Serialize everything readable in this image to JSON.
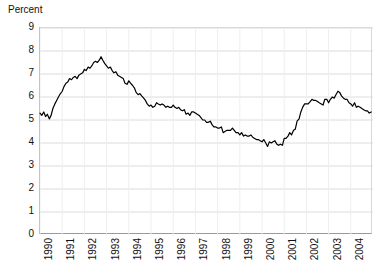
{
  "chart_data": {
    "type": "line",
    "title": "",
    "subtitle": "",
    "ylabel": "Percent",
    "xlabel": "",
    "ylim": [
      0,
      9
    ],
    "yticks": [
      0,
      1,
      2,
      3,
      4,
      5,
      6,
      7,
      8,
      9
    ],
    "ytick_labels": [
      "0",
      "1",
      "2",
      "3",
      "4",
      "5",
      "6",
      "7",
      "8",
      "9"
    ],
    "xlim": [
      1990.0,
      2005.0
    ],
    "xticks": [
      1990,
      1991,
      1992,
      1993,
      1994,
      1995,
      1996,
      1997,
      1998,
      1999,
      2000,
      2001,
      2002,
      2003,
      2004
    ],
    "xtick_labels": [
      "1990",
      "1991",
      "1992",
      "1993",
      "1994",
      "1995",
      "1996",
      "1997",
      "1998",
      "1999",
      "2000",
      "2001",
      "2002",
      "2003",
      "2004"
    ],
    "grid": true,
    "grid_color": "#dcdcdc",
    "legend": false,
    "legend_position": "none",
    "line_color": "#000000",
    "line_width": 1.2,
    "annotations": [],
    "series": [
      {
        "name": "Percent",
        "x": [
          1990.0,
          1990.08,
          1990.17,
          1990.25,
          1990.33,
          1990.42,
          1990.5,
          1990.58,
          1990.67,
          1990.75,
          1990.83,
          1990.92,
          1991.0,
          1991.08,
          1991.17,
          1991.25,
          1991.33,
          1991.42,
          1991.5,
          1991.58,
          1991.67,
          1991.75,
          1991.83,
          1991.92,
          1992.0,
          1992.08,
          1992.17,
          1992.25,
          1992.33,
          1992.42,
          1992.5,
          1992.58,
          1992.67,
          1992.75,
          1992.83,
          1992.92,
          1993.0,
          1993.08,
          1993.17,
          1993.25,
          1993.33,
          1993.42,
          1993.5,
          1993.58,
          1993.67,
          1993.75,
          1993.83,
          1993.92,
          1994.0,
          1994.08,
          1994.17,
          1994.25,
          1994.33,
          1994.42,
          1994.5,
          1994.58,
          1994.67,
          1994.75,
          1994.83,
          1994.92,
          1995.0,
          1995.08,
          1995.17,
          1995.25,
          1995.33,
          1995.42,
          1995.5,
          1995.58,
          1995.67,
          1995.75,
          1995.83,
          1995.92,
          1996.0,
          1996.08,
          1996.17,
          1996.25,
          1996.33,
          1996.42,
          1996.5,
          1996.58,
          1996.67,
          1996.75,
          1996.83,
          1996.92,
          1997.0,
          1997.08,
          1997.17,
          1997.25,
          1997.33,
          1997.42,
          1997.5,
          1997.58,
          1997.67,
          1997.75,
          1997.83,
          1997.92,
          1998.0,
          1998.08,
          1998.17,
          1998.25,
          1998.33,
          1998.42,
          1998.5,
          1998.58,
          1998.67,
          1998.75,
          1998.83,
          1998.92,
          1999.0,
          1999.08,
          1999.17,
          1999.25,
          1999.33,
          1999.42,
          1999.5,
          1999.58,
          1999.67,
          1999.75,
          1999.83,
          1999.92,
          2000.0,
          2000.08,
          2000.17,
          2000.25,
          2000.33,
          2000.42,
          2000.5,
          2000.58,
          2000.67,
          2000.75,
          2000.83,
          2000.92,
          2001.0,
          2001.08,
          2001.17,
          2001.25,
          2001.33,
          2001.42,
          2001.5,
          2001.58,
          2001.67,
          2001.75,
          2001.83,
          2001.92,
          2002.0,
          2002.08,
          2002.17,
          2002.25,
          2002.33,
          2002.42,
          2002.5,
          2002.58,
          2002.67,
          2002.75,
          2002.83,
          2002.92,
          2003.0,
          2003.08,
          2003.17,
          2003.25,
          2003.33,
          2003.42,
          2003.5,
          2003.58,
          2003.67,
          2003.75,
          2003.83,
          2003.92,
          2004.0,
          2004.08,
          2004.17,
          2004.25,
          2004.33,
          2004.42,
          2004.5,
          2004.58,
          2004.67,
          2004.75,
          2004.83,
          2004.92
        ],
        "values": [
          5.3,
          5.2,
          5.35,
          5.15,
          5.25,
          5.05,
          5.2,
          5.5,
          5.7,
          5.85,
          6.0,
          6.15,
          6.25,
          6.45,
          6.6,
          6.65,
          6.8,
          6.75,
          6.85,
          6.9,
          6.8,
          6.95,
          7.0,
          7.05,
          7.2,
          7.15,
          7.3,
          7.25,
          7.35,
          7.5,
          7.55,
          7.5,
          7.6,
          7.75,
          7.6,
          7.45,
          7.35,
          7.25,
          7.3,
          7.15,
          7.05,
          7.1,
          6.95,
          6.9,
          6.85,
          6.8,
          6.6,
          6.55,
          6.7,
          6.6,
          6.5,
          6.4,
          6.2,
          6.1,
          6.15,
          6.05,
          5.95,
          5.85,
          5.7,
          5.6,
          5.65,
          5.55,
          5.6,
          5.75,
          5.7,
          5.65,
          5.7,
          5.65,
          5.55,
          5.6,
          5.55,
          5.55,
          5.65,
          5.55,
          5.5,
          5.55,
          5.45,
          5.4,
          5.45,
          5.25,
          5.3,
          5.2,
          5.35,
          5.35,
          5.3,
          5.25,
          5.2,
          5.1,
          5.0,
          5.0,
          4.9,
          4.9,
          4.95,
          4.8,
          4.7,
          4.7,
          4.65,
          4.65,
          4.7,
          4.45,
          4.5,
          4.55,
          4.55,
          4.55,
          4.65,
          4.55,
          4.45,
          4.45,
          4.35,
          4.45,
          4.3,
          4.35,
          4.3,
          4.3,
          4.35,
          4.25,
          4.2,
          4.15,
          4.15,
          4.1,
          4.05,
          4.15,
          4.0,
          3.85,
          4.05,
          4.0,
          4.05,
          4.1,
          3.95,
          3.9,
          3.95,
          3.9,
          4.2,
          4.2,
          4.3,
          4.45,
          4.35,
          4.55,
          4.6,
          4.95,
          5.05,
          5.35,
          5.55,
          5.7,
          5.7,
          5.7,
          5.8,
          5.9,
          5.85,
          5.85,
          5.8,
          5.75,
          5.7,
          5.65,
          5.9,
          5.9,
          5.75,
          5.9,
          6.0,
          5.95,
          6.1,
          6.25,
          6.2,
          6.05,
          5.95,
          5.9,
          5.9,
          5.75,
          5.7,
          5.6,
          5.75,
          5.55,
          5.6,
          5.55,
          5.5,
          5.45,
          5.4,
          5.4,
          5.3,
          5.35
        ]
      }
    ]
  }
}
